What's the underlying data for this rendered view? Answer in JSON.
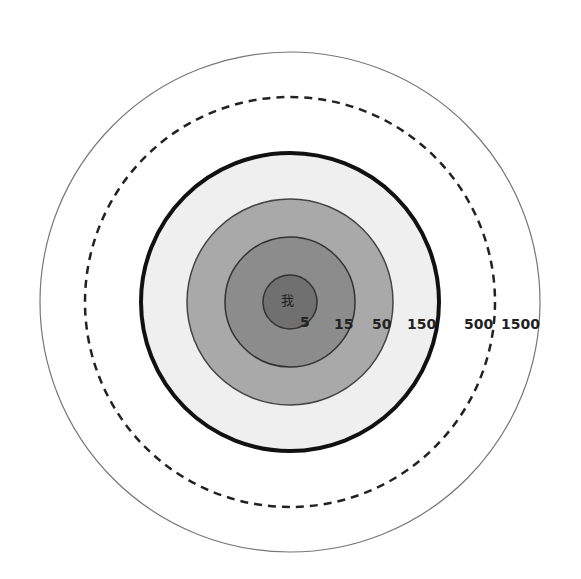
{
  "diagram": {
    "type": "concentric-circles",
    "center_label": "我",
    "circles": [
      {
        "label": "5",
        "radius": 27,
        "fill": "#707070",
        "stroke": "#333333",
        "stroke_width": 1.5,
        "dash": ""
      },
      {
        "label": "15",
        "radius": 65,
        "fill": "#8c8c8c",
        "stroke": "#333333",
        "stroke_width": 1.5,
        "dash": ""
      },
      {
        "label": "50",
        "radius": 103,
        "fill": "#a9a9a9",
        "stroke": "#444444",
        "stroke_width": 1.5,
        "dash": ""
      },
      {
        "label": "150",
        "radius": 149,
        "fill": "#efefef",
        "stroke": "#111111",
        "stroke_width": 4,
        "dash": ""
      },
      {
        "label": "500",
        "radius": 205,
        "fill": "none",
        "stroke": "#222222",
        "stroke_width": 2.5,
        "dash": "8 6"
      },
      {
        "label": "1500",
        "radius": 250,
        "fill": "none",
        "stroke": "#777777",
        "stroke_width": 1.2,
        "dash": ""
      }
    ],
    "labels": [
      {
        "text": "5",
        "x": 300,
        "y": 327
      },
      {
        "text": "15",
        "x": 334,
        "y": 329
      },
      {
        "text": "50",
        "x": 372,
        "y": 329
      },
      {
        "text": "150",
        "x": 407,
        "y": 329
      },
      {
        "text": "500",
        "x": 464,
        "y": 329
      },
      {
        "text": "1500",
        "x": 501,
        "y": 329
      }
    ]
  }
}
